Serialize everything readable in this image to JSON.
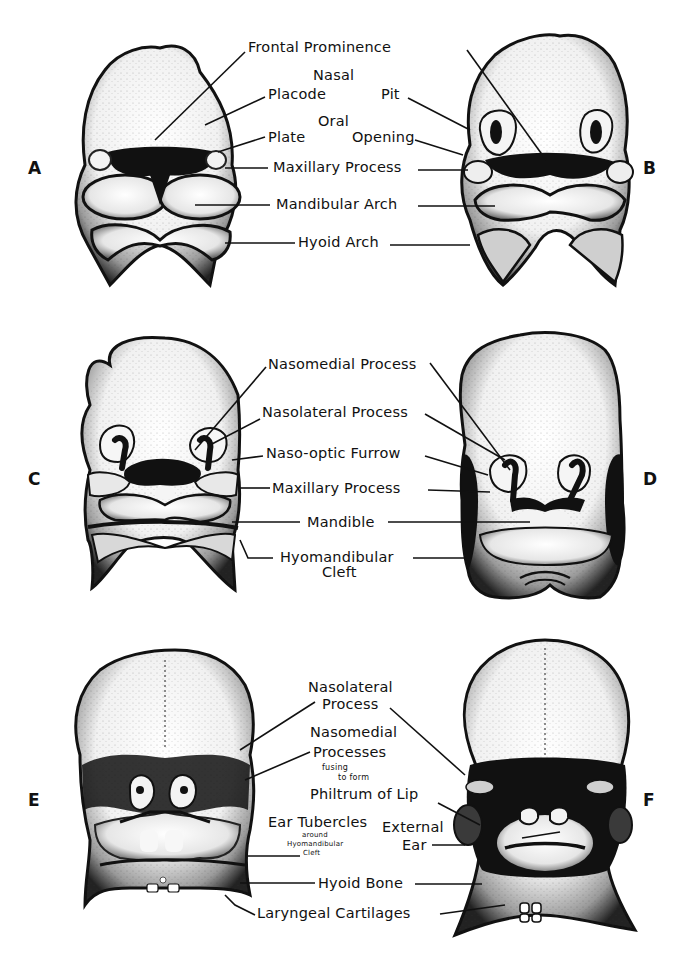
{
  "figure": {
    "background": "#ffffff",
    "ink": "#111111"
  },
  "panels": [
    {
      "letter": "A",
      "x": 28,
      "y": 158
    },
    {
      "letter": "B",
      "x": 643,
      "y": 158
    },
    {
      "letter": "C",
      "x": 28,
      "y": 469
    },
    {
      "letter": "D",
      "x": 643,
      "y": 469
    },
    {
      "letter": "E",
      "x": 28,
      "y": 790
    },
    {
      "letter": "F",
      "x": 643,
      "y": 790
    }
  ],
  "labels": {
    "row1": {
      "frontal_prominence": "Frontal Prominence",
      "nasal": "Nasal",
      "placode": "Placode",
      "pit": "Pit",
      "oral": "Oral",
      "plate": "Plate",
      "opening": "Opening",
      "maxillary_process": "Maxillary Process",
      "mandibular_arch": "Mandibular Arch",
      "hyoid_arch": "Hyoid Arch"
    },
    "row2": {
      "nasomedial_process": "Nasomedial Process",
      "nasolateral_process": "Nasolateral Process",
      "naso_optic_furrow": "Naso-optic Furrow",
      "maxillary_process": "Maxillary Process",
      "mandible": "Mandible",
      "hyomandibular": "Hyomandibular",
      "cleft": "Cleft"
    },
    "row3": {
      "nasolateral": "Nasolateral",
      "process": "Process",
      "nasomedial": "Nasomedial",
      "processes": "Processes",
      "fusing": "fusing",
      "to_form": "to form",
      "philtrum_of_lip": "Philtrum of Lip",
      "ear_tubercles": "Ear Tubercles",
      "around": "around",
      "hyomandibular_cleft_line1": "Hyomandibular",
      "hyomandibular_cleft_line2": "Cleft",
      "external": "External",
      "ear": "Ear",
      "hyoid_bone": "Hyoid Bone",
      "laryngeal_cartilages": "Laryngeal Cartilages"
    }
  }
}
